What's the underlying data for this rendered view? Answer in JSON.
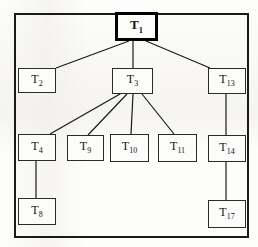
{
  "figure": {
    "frame": {
      "x": 14,
      "y": 13,
      "width": 235,
      "height": 225
    },
    "canvas": {
      "width": 258,
      "height": 247
    },
    "colors": {
      "ink": "#1a1a1a",
      "node_border": "#2b2b2b",
      "root_border": "#000000",
      "node_fill": "#fcfcfa",
      "paper": "#fbfbf9"
    }
  },
  "nodes": [
    {
      "id": "T1",
      "label": "T",
      "sub": "1",
      "x": 115,
      "y": 12,
      "width": 43,
      "height": 29,
      "root": true
    },
    {
      "id": "T2",
      "label": "T",
      "sub": "2",
      "x": 18,
      "y": 68,
      "width": 38,
      "height": 25,
      "root": false
    },
    {
      "id": "T3",
      "label": "T",
      "sub": "3",
      "x": 112,
      "y": 68,
      "width": 41,
      "height": 26,
      "root": false
    },
    {
      "id": "T13",
      "label": "T",
      "sub": "13",
      "x": 208,
      "y": 68,
      "width": 38,
      "height": 26,
      "root": false
    },
    {
      "id": "T4",
      "label": "T",
      "sub": "4",
      "x": 18,
      "y": 134,
      "width": 38,
      "height": 27,
      "root": false
    },
    {
      "id": "T9",
      "label": "T",
      "sub": "9",
      "x": 67,
      "y": 135,
      "width": 37,
      "height": 26,
      "root": false
    },
    {
      "id": "T10",
      "label": "T",
      "sub": "10",
      "x": 110,
      "y": 134,
      "width": 39,
      "height": 28,
      "root": false
    },
    {
      "id": "T11",
      "label": "T",
      "sub": "11",
      "x": 158,
      "y": 134,
      "width": 39,
      "height": 28,
      "root": false
    },
    {
      "id": "T14",
      "label": "T",
      "sub": "14",
      "x": 208,
      "y": 135,
      "width": 38,
      "height": 27,
      "root": false
    },
    {
      "id": "T8",
      "label": "T",
      "sub": "8",
      "x": 18,
      "y": 198,
      "width": 38,
      "height": 27,
      "root": false
    },
    {
      "id": "T17",
      "label": "T",
      "sub": "17",
      "x": 208,
      "y": 200,
      "width": 38,
      "height": 28,
      "root": false
    }
  ],
  "edges": [
    {
      "from": "T1",
      "to": "T2",
      "x1": 129,
      "y1": 41,
      "x2": 56,
      "y2": 68
    },
    {
      "from": "T1",
      "to": "T3",
      "x1": 133,
      "y1": 41,
      "x2": 133,
      "y2": 68
    },
    {
      "from": "T1",
      "to": "T13",
      "x1": 146,
      "y1": 41,
      "x2": 210,
      "y2": 68
    },
    {
      "from": "T3",
      "to": "T4",
      "x1": 120,
      "y1": 94,
      "x2": 50,
      "y2": 134
    },
    {
      "from": "T3",
      "to": "T9",
      "x1": 127,
      "y1": 94,
      "x2": 88,
      "y2": 135
    },
    {
      "from": "T3",
      "to": "T10",
      "x1": 133,
      "y1": 94,
      "x2": 131,
      "y2": 134
    },
    {
      "from": "T3",
      "to": "T11",
      "x1": 142,
      "y1": 94,
      "x2": 174,
      "y2": 134
    },
    {
      "from": "T4",
      "to": "T8",
      "x1": 36,
      "y1": 161,
      "x2": 36,
      "y2": 198
    },
    {
      "from": "T13",
      "to": "T14",
      "x1": 226,
      "y1": 94,
      "x2": 226,
      "y2": 135
    },
    {
      "from": "T14",
      "to": "T17",
      "x1": 226,
      "y1": 162,
      "x2": 226,
      "y2": 200
    }
  ]
}
